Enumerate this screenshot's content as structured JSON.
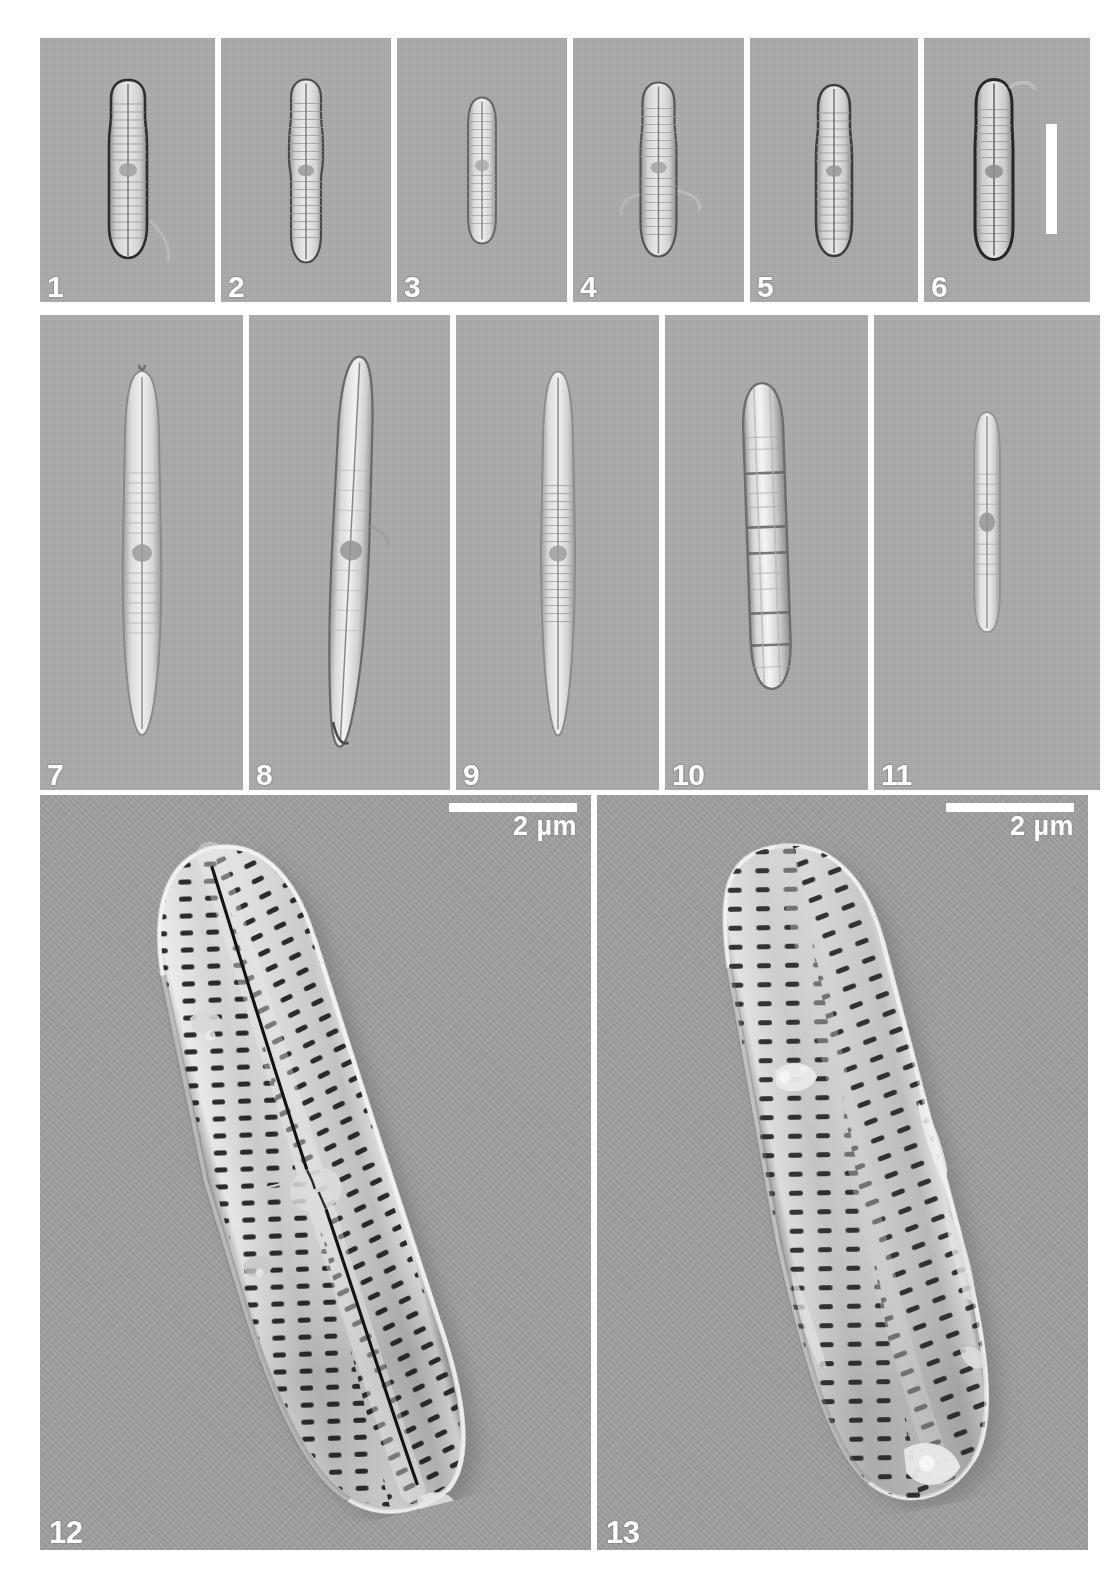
{
  "figure": {
    "kind": "diatom-micrograph-plate",
    "background_color": "#ffffff",
    "plate_gray": "#a9a9a9",
    "sem_gray": "#9d9d9d",
    "label_color": "#ffffff"
  },
  "rows": [
    {
      "id": "row-lm-1",
      "modality": "LM",
      "panels": [
        {
          "number": "1",
          "width": 175,
          "valve_w": 46,
          "valve_h": 170,
          "shape": "linear-lanceolate-capitate",
          "outline": "dark",
          "striae": true
        },
        {
          "number": "2",
          "width": 170,
          "valve_w": 38,
          "valve_h": 175,
          "shape": "linear-constricted",
          "outline": "medium",
          "striae": true
        },
        {
          "number": "3",
          "width": 170,
          "valve_w": 33,
          "valve_h": 140,
          "shape": "linear-elliptic",
          "outline": "light",
          "striae": true
        },
        {
          "number": "4",
          "width": 171,
          "valve_w": 40,
          "valve_h": 165,
          "shape": "linear-lanceolate",
          "outline": "medium",
          "striae": true
        },
        {
          "number": "5",
          "width": 168,
          "valve_w": 42,
          "valve_h": 162,
          "shape": "linear-lanceolate",
          "outline": "dark",
          "striae": true
        },
        {
          "number": "6",
          "width": 166,
          "valve_w": 44,
          "valve_h": 180,
          "shape": "linear-capitate",
          "outline": "dark",
          "striae": true,
          "scalebar": {
            "orientation": "vertical",
            "label": ""
          }
        }
      ]
    },
    {
      "id": "row-lm-2",
      "modality": "LM",
      "panels": [
        {
          "number": "7",
          "width": 203,
          "valve_w": 40,
          "valve_h": 330,
          "shape": "lanceolate-elongate",
          "outline": "light",
          "striae": true
        },
        {
          "number": "8",
          "width": 201,
          "valve_w": 36,
          "valve_h": 360,
          "shape": "lanceolate-elongate",
          "outline": "medium",
          "striae": false
        },
        {
          "number": "9",
          "width": 203,
          "valve_w": 36,
          "valve_h": 330,
          "shape": "lanceolate-elongate",
          "outline": "light",
          "striae": true
        },
        {
          "number": "10",
          "width": 203,
          "valve_w": 44,
          "valve_h": 275,
          "shape": "girdle-view",
          "outline": "medium",
          "striae": false
        },
        {
          "number": "11",
          "width": 226,
          "valve_w": 30,
          "valve_h": 200,
          "shape": "linear-small",
          "outline": "light",
          "striae": true
        }
      ]
    },
    {
      "id": "row-sem",
      "modality": "SEM",
      "panels": [
        {
          "number": "12",
          "width": 551,
          "view": "external-raphe-valve",
          "rotation": -14,
          "valve_w": 250,
          "valve_h": 620,
          "raphe": true,
          "scalebar": {
            "orientation": "horizontal",
            "label": "2 µm",
            "length": 128
          }
        },
        {
          "number": "13",
          "width": 491,
          "view": "rapheless-sternum-valve",
          "rotation": -11,
          "valve_w": 250,
          "valve_h": 600,
          "raphe": false,
          "scalebar": {
            "orientation": "horizontal",
            "label": "2 µm",
            "length": 128
          }
        }
      ]
    }
  ]
}
